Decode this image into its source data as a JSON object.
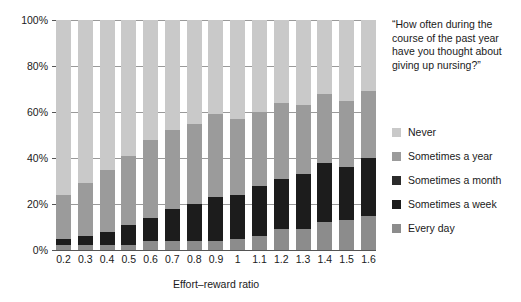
{
  "chart_data": {
    "type": "bar",
    "subtype": "stacked-bar-100-percent",
    "title": "“How often during the course of the past year have you thought about giving up nursing?”",
    "xlabel": "Effort–reward ratio",
    "ylabel": "",
    "ylim": [
      0,
      100
    ],
    "ytick_labels": [
      "100%",
      "80%",
      "60%",
      "40%",
      "20%",
      "0%"
    ],
    "ytick_values": [
      100,
      80,
      60,
      40,
      20,
      0
    ],
    "grid": true,
    "grid_axis": "y",
    "legend_position": "right",
    "categories": [
      "0.2",
      "0.3",
      "0.4",
      "0.5",
      "0.6",
      "0.7",
      "0.8",
      "0.9",
      "1",
      "1.1",
      "1.2",
      "1.3",
      "1.4",
      "1.5",
      "1.6"
    ],
    "stack_order_bottom_to_top": [
      "Every day",
      "Sometimes a week",
      "Sometimes a month",
      "Sometimes a year",
      "Never"
    ],
    "series": [
      {
        "name": "Every day",
        "color": "#8c8c8c",
        "values": [
          2,
          2,
          2,
          2,
          4,
          4,
          4,
          4,
          5,
          6,
          9,
          9,
          12,
          13,
          15
        ]
      },
      {
        "name": "Sometimes a week",
        "color": "#1c1c1c",
        "values": [
          3,
          4,
          6,
          9,
          10,
          14,
          16,
          19,
          19,
          22,
          22,
          24,
          26,
          23,
          25
        ]
      },
      {
        "name": "Sometimes a month",
        "color": "#2b2b2b",
        "values": [
          0,
          0,
          0,
          0,
          0,
          0,
          0,
          0,
          0,
          0,
          0,
          0,
          0,
          0,
          0
        ]
      },
      {
        "name": "Sometimes a year",
        "color": "#9b9b9b",
        "values": [
          19,
          23,
          27,
          30,
          34,
          34,
          35,
          36,
          33,
          32,
          33,
          30,
          30,
          29,
          29
        ]
      },
      {
        "name": "Never",
        "color": "#c9c9c9",
        "values": [
          76,
          71,
          65,
          59,
          52,
          48,
          45,
          41,
          43,
          40,
          36,
          37,
          32,
          35,
          31
        ]
      }
    ]
  },
  "question": {
    "text": "“How often during the course of the past year have you thought about giving up nursing?”"
  },
  "legend": {
    "items": [
      {
        "label": "Never",
        "color": "#c9c9c9"
      },
      {
        "label": "Sometimes a year",
        "color": "#9b9b9b"
      },
      {
        "label": "Sometimes a month",
        "color": "#2b2b2b"
      },
      {
        "label": "Sometimes a week",
        "color": "#1c1c1c"
      },
      {
        "label": "Every day",
        "color": "#8c8c8c"
      }
    ]
  },
  "axes": {
    "x_title": "Effort–reward ratio",
    "y_ticks": [
      "100%",
      "80%",
      "60%",
      "40%",
      "20%",
      "0%"
    ],
    "x_ticks": [
      "0.2",
      "0.3",
      "0.4",
      "0.5",
      "0.6",
      "0.7",
      "0.8",
      "0.9",
      "1",
      "1.1",
      "1.2",
      "1.3",
      "1.4",
      "1.5",
      "1.6"
    ]
  }
}
